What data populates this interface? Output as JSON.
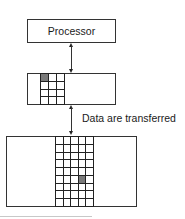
{
  "diagram": {
    "processor": {
      "label": "Processor"
    },
    "cache": {
      "columns": 3,
      "rows": 4,
      "highlight": {
        "row": 0,
        "col": 0
      }
    },
    "memory": {
      "columns": 5,
      "rows": 9,
      "highlight": {
        "row": 5,
        "col": 3
      }
    },
    "transfer_label": "Data are transferred",
    "colors": {
      "stroke": "#333333",
      "highlight": "#7a7a7a",
      "background": "#ffffff"
    }
  }
}
